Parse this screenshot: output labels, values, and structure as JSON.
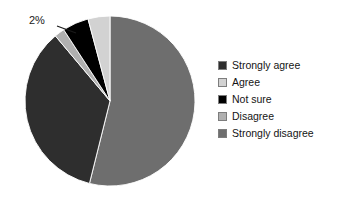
{
  "chart_data": {
    "type": "pie",
    "title": "",
    "categories": [
      "Strongly agree",
      "Agree",
      "Not sure",
      "Disagree",
      "Strongly disagree"
    ],
    "values": [
      35,
      4,
      5,
      2,
      54
    ],
    "unit": "%",
    "colors": [
      "#2e2e2e",
      "#d2d2d2",
      "#000000",
      "#b0b0b0",
      "#6e6e6e"
    ],
    "legend_position": "right",
    "grid": false,
    "start_angle_deg": 0,
    "direction": "clockwise",
    "data_labels": [
      {
        "label": "2%",
        "series": "Disagree",
        "value": 2
      }
    ],
    "slices": [
      {
        "name": "Strongly disagree",
        "value": 54,
        "color": "#6e6e6e",
        "start_deg": 0,
        "end_deg": 194
      },
      {
        "name": "Strongly agree",
        "value": 35,
        "color": "#2e2e2e",
        "start_deg": 194,
        "end_deg": 320
      },
      {
        "name": "Disagree",
        "value": 2,
        "color": "#b0b0b0",
        "start_deg": 320,
        "end_deg": 327
      },
      {
        "name": "Not sure",
        "value": 5,
        "color": "#000000",
        "start_deg": 327,
        "end_deg": 345
      },
      {
        "name": "Agree",
        "value": 4,
        "color": "#d2d2d2",
        "start_deg": 345,
        "end_deg": 360
      }
    ]
  },
  "callout": {
    "text": "2%"
  },
  "legend": {
    "items": [
      {
        "label": "Strongly agree",
        "color": "#2e2e2e"
      },
      {
        "label": "Agree",
        "color": "#d2d2d2"
      },
      {
        "label": "Not sure",
        "color": "#000000"
      },
      {
        "label": "Disagree",
        "color": "#b0b0b0"
      },
      {
        "label": "Strongly disagree",
        "color": "#6e6e6e"
      }
    ]
  }
}
